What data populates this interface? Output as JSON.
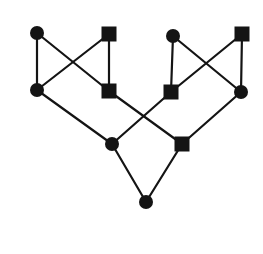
{
  "diagram": {
    "type": "graph",
    "canvas": {
      "width": 263,
      "height": 254,
      "background": "#ffffff"
    },
    "style": {
      "ink_color": "#141414",
      "edge_width": 2.2,
      "circle_radius": 7,
      "square_size": 15
    },
    "nodes": [
      {
        "id": "n1",
        "shape": "circle",
        "x": 37,
        "y": 33
      },
      {
        "id": "n2",
        "shape": "square",
        "x": 109,
        "y": 34
      },
      {
        "id": "n3",
        "shape": "circle",
        "x": 173,
        "y": 36
      },
      {
        "id": "n4",
        "shape": "square",
        "x": 242,
        "y": 34
      },
      {
        "id": "n5",
        "shape": "circle",
        "x": 37,
        "y": 90
      },
      {
        "id": "n6",
        "shape": "square",
        "x": 109,
        "y": 91
      },
      {
        "id": "n7",
        "shape": "square",
        "x": 171,
        "y": 92
      },
      {
        "id": "n8",
        "shape": "circle",
        "x": 241,
        "y": 92
      },
      {
        "id": "n9",
        "shape": "circle",
        "x": 112,
        "y": 144
      },
      {
        "id": "n10",
        "shape": "square",
        "x": 182,
        "y": 144
      },
      {
        "id": "n11",
        "shape": "circle",
        "x": 146,
        "y": 202
      }
    ],
    "edges": [
      {
        "from": "n1",
        "to": "n5"
      },
      {
        "from": "n1",
        "to": "n6"
      },
      {
        "from": "n2",
        "to": "n5"
      },
      {
        "from": "n2",
        "to": "n6"
      },
      {
        "from": "n3",
        "to": "n7"
      },
      {
        "from": "n3",
        "to": "n8"
      },
      {
        "from": "n4",
        "to": "n7"
      },
      {
        "from": "n4",
        "to": "n8"
      },
      {
        "from": "n5",
        "to": "n9"
      },
      {
        "from": "n6",
        "to": "n10"
      },
      {
        "from": "n7",
        "to": "n9"
      },
      {
        "from": "n8",
        "to": "n10"
      },
      {
        "from": "n9",
        "to": "n11"
      },
      {
        "from": "n10",
        "to": "n11"
      }
    ]
  }
}
